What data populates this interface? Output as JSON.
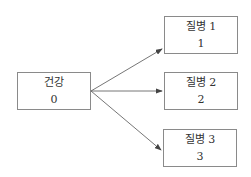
{
  "diagram": {
    "type": "state-transition",
    "nodes": [
      {
        "id": "healthy",
        "label": "건강",
        "value": "0"
      },
      {
        "id": "disease1",
        "label": "질병 1",
        "value": "1"
      },
      {
        "id": "disease2",
        "label": "질병 2",
        "value": "2"
      },
      {
        "id": "disease3",
        "label": "질병 3",
        "value": "3"
      }
    ],
    "edges": [
      {
        "from": "healthy",
        "to": "disease1"
      },
      {
        "from": "healthy",
        "to": "disease2"
      },
      {
        "from": "healthy",
        "to": "disease3"
      }
    ],
    "colors": {
      "line": "#555555",
      "border": "#8a8a8a",
      "text": "#333333"
    }
  }
}
